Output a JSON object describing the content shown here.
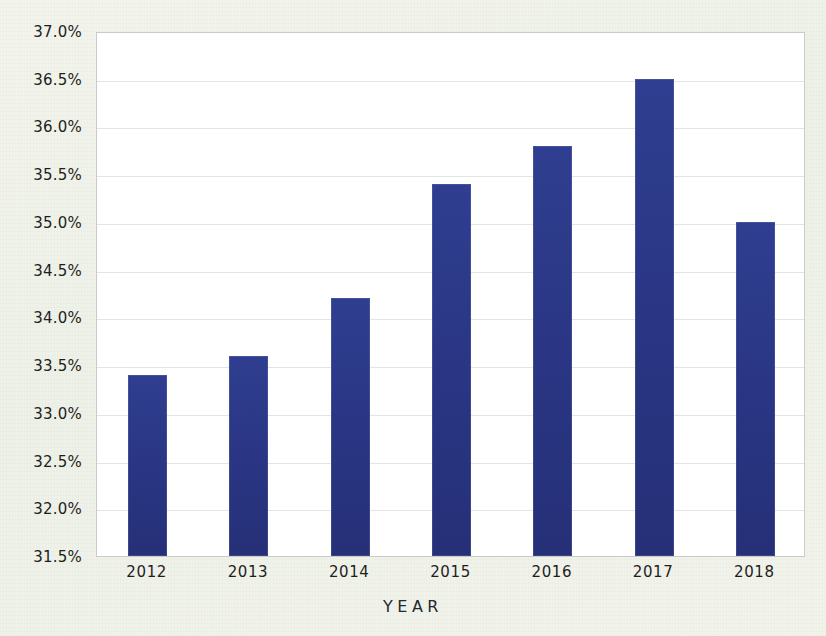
{
  "chart_data": {
    "type": "bar",
    "title": "",
    "subtitle": "",
    "xlabel": "YEAR",
    "ylabel": "",
    "categories": [
      "2012",
      "2013",
      "2014",
      "2015",
      "2016",
      "2017",
      "2018"
    ],
    "values": [
      33.4,
      33.6,
      34.2,
      35.4,
      35.8,
      36.5,
      35.0
    ],
    "value_labels": [
      "33.4%",
      "33.6%",
      "34.2%",
      "35.4%",
      "35.8%",
      "36.5%",
      "35.0%"
    ],
    "series": [
      {
        "name": "",
        "values": [
          33.4,
          33.6,
          34.2,
          35.4,
          35.8,
          36.5,
          35.0
        ]
      }
    ],
    "ylim": [
      31.5,
      37.0
    ],
    "y_tick_values": [
      37.0,
      36.5,
      36.0,
      35.5,
      35.0,
      34.5,
      34.0,
      33.5,
      33.0,
      32.5,
      32.0,
      31.5
    ],
    "y_tick_labels": [
      "37.0%",
      "36.5%",
      "36.0%",
      "35.5%",
      "35.0%",
      "34.5%",
      "34.0%",
      "33.5%",
      "33.0%",
      "32.5%",
      "32.0%",
      "31.5%"
    ],
    "x_tick_labels": [
      "2012",
      "2013",
      "2014",
      "2015",
      "2016",
      "2017",
      "2018"
    ],
    "grid": "horizontal",
    "legend": "none",
    "legend_entries": [],
    "annotations": [],
    "colors": {
      "bar": "#2a3684",
      "gridline": "#e2e5e6",
      "plot_background": "#ffffff",
      "page_background": "#f1f3eb",
      "axis_text": "#1e1e1e",
      "plot_border": "#c9ccc6"
    },
    "bar_width_px": 39,
    "plot_area_px": {
      "left": 96,
      "top": 32,
      "width": 709,
      "height": 525
    }
  }
}
